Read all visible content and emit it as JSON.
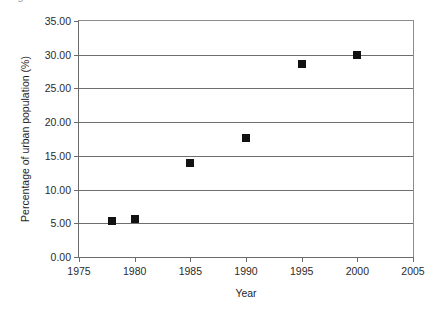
{
  "figure": {
    "background_color": "#ffffff",
    "clipped_title": "Figure: Urbanization trend",
    "marker_color": "#111111",
    "grid_color": "#6f6f6f",
    "axis_color": "#6b6b6b"
  },
  "chart_data": {
    "type": "scatter",
    "title": "",
    "xlabel": "Year",
    "ylabel": "Percentage of urban population (%)",
    "xlim": [
      1975,
      2005
    ],
    "ylim": [
      0,
      35
    ],
    "xticks": [
      1975,
      1980,
      1985,
      1990,
      1995,
      2000,
      2005
    ],
    "xtick_labels": [
      "1975",
      "1980",
      "1985",
      "1990",
      "1995",
      "2000",
      "2005"
    ],
    "yticks": [
      0,
      5,
      10,
      15,
      20,
      25,
      30,
      35
    ],
    "ytick_labels": [
      "0.00",
      "5.00",
      "10.00",
      "15.00",
      "20.00",
      "25.00",
      "30.00",
      "35.00"
    ],
    "grid": "horizontal",
    "legend": "none",
    "marker": "square",
    "x": [
      1978,
      1980,
      1985,
      1990,
      1995,
      2000
    ],
    "y": [
      5.3,
      5.6,
      14.0,
      17.6,
      28.6,
      30.0
    ],
    "points": [
      {
        "x": 1978,
        "y": 5.3
      },
      {
        "x": 1980,
        "y": 5.6
      },
      {
        "x": 1985,
        "y": 14.0
      },
      {
        "x": 1990,
        "y": 17.6
      },
      {
        "x": 1995,
        "y": 28.6
      },
      {
        "x": 2000,
        "y": 30.0
      }
    ]
  }
}
